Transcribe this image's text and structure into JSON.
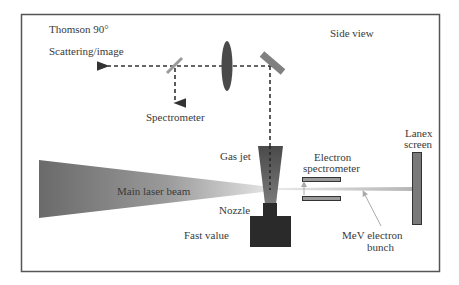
{
  "diagram": {
    "labels": {
      "thomson": "Thomson 90°",
      "scattering": "Scattering/image",
      "side_view": "Side view",
      "spectrometer": "Spectrometer",
      "gas_jet": "Gas jet",
      "electron": "Electron",
      "spectrometer_lower": "spectrometer",
      "lanex": "Lanex",
      "screen": "screen",
      "main_laser_beam": "Main laser beam",
      "nozzle": "Nozzle",
      "fast_value": "Fast value",
      "mev_electron": "MeV electron",
      "bunch": "bunch"
    },
    "colors": {
      "frame": "#555555",
      "lens": "#4a4a4a",
      "mirror": "#8a8a8a",
      "valve": "#2a2a2a",
      "nozzle": "#5a5a5a",
      "screen": "#7a7a7a",
      "beam_dark": "#6a6a6a",
      "beam_light": "#e0e0e0",
      "dash": "#333333"
    }
  }
}
